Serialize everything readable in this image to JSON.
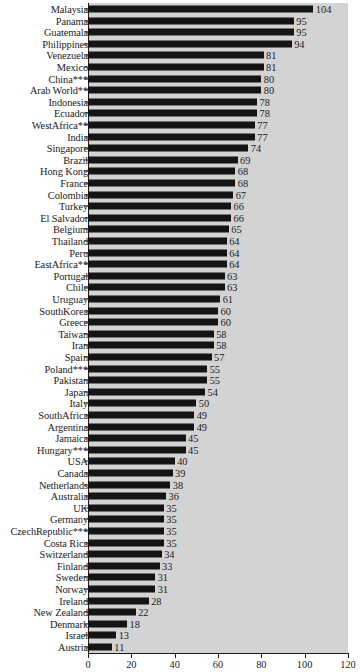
{
  "chart_data": {
    "type": "bar",
    "orientation": "horizontal",
    "title": "",
    "subtitle": "",
    "xlabel": "",
    "ylabel": "",
    "xlim": [
      0,
      120
    ],
    "xticks": [
      0,
      20,
      40,
      60,
      80,
      100,
      120
    ],
    "grid": false,
    "legend": null,
    "bar_color": "#141414",
    "plot_background_color": "#d3d3d3",
    "axis_color": "#1a1a1a",
    "text_color": "#1c1c1c",
    "value_labels_shown": true,
    "categories": [
      "Malaysia",
      "Panama",
      "Guatemala",
      "Philippines",
      "Venezuela",
      "Mexico",
      "China***",
      "Arab World**",
      "Indonesia",
      "Ecuador",
      "WestAfrica**",
      "India",
      "Singapore",
      "Brazil",
      "Hong Kong",
      "France",
      "Colombia",
      "Turkey",
      "El Salvador",
      "Belgium",
      "Thailand",
      "Peru",
      "EastAfrica**",
      "Portugal",
      "Chile",
      "Uruguay",
      "SouthKorea",
      "Greece",
      "Taiwan",
      "Iran",
      "Spain",
      "Poland***",
      "Pakistan",
      "Japan",
      "Italy",
      "SouthAfrica",
      "Argentina",
      "Jamaica",
      "Hungary***",
      "USA",
      "Canada",
      "Netherlands",
      "Australia",
      "UK",
      "Germany",
      "CzechRepublic***",
      "Costa Rica",
      "Switzerland",
      "Finland",
      "Sweden",
      "Norway",
      "Ireland",
      "New Zealand",
      "Denmark",
      "Israel",
      "Austria"
    ],
    "values": [
      104,
      95,
      95,
      94,
      81,
      81,
      80,
      80,
      78,
      78,
      77,
      77,
      74,
      69,
      68,
      68,
      67,
      66,
      66,
      65,
      64,
      64,
      64,
      63,
      63,
      61,
      60,
      60,
      58,
      58,
      57,
      55,
      55,
      54,
      50,
      49,
      49,
      45,
      45,
      40,
      39,
      38,
      36,
      35,
      35,
      35,
      35,
      34,
      33,
      31,
      31,
      28,
      22,
      18,
      13,
      11
    ]
  }
}
